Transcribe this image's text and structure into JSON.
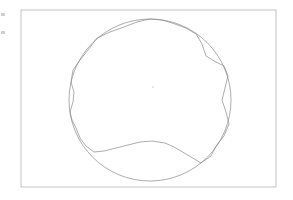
{
  "figure": {
    "title": "",
    "caption": "",
    "background_color": "#ffffff",
    "line_color": "#808080",
    "frame_color": "#b4b4b4",
    "center_mark_color": "#e2e2e2"
  },
  "frame": {
    "name": "plot-frame",
    "x": 21,
    "y": 10,
    "width": 255,
    "height": 177,
    "stroke_width": 0.8
  },
  "center_mark": {
    "x": 153,
    "y": 87,
    "radius": 1.1
  },
  "edge_artifacts": [
    {
      "name": "edge-tick-upper",
      "x": 1,
      "y": 13,
      "width": 4,
      "height": 3
    },
    {
      "name": "edge-tick-lower",
      "x": 1,
      "y": 31,
      "width": 4,
      "height": 3
    }
  ],
  "chart_data": {
    "type": "scatter",
    "title": "",
    "subtitle": "",
    "xlabel": "",
    "ylabel": "",
    "grid": false,
    "legend_position": "none",
    "xlim": [
      21,
      276
    ],
    "ylim": [
      10,
      187
    ],
    "tick_labels": {
      "x": [],
      "y": []
    },
    "annotations": [],
    "series": [
      {
        "name": "circle",
        "kind": "circle",
        "center": [
          150,
          100
        ],
        "radius": 81,
        "stroke": "#8a8a8a",
        "stroke_width": 0.7,
        "fill": "none"
      },
      {
        "name": "polygon",
        "kind": "closed-polyline",
        "stroke": "#8a8a8a",
        "stroke_width": 0.7,
        "fill": "none",
        "points": [
          [
            150,
            19
          ],
          [
            162,
            20
          ],
          [
            172,
            23
          ],
          [
            186,
            28
          ],
          [
            196,
            34
          ],
          [
            202,
            44
          ],
          [
            206,
            56
          ],
          [
            216,
            62
          ],
          [
            224,
            66
          ],
          [
            228,
            76
          ],
          [
            225,
            88
          ],
          [
            222,
            100
          ],
          [
            226,
            112
          ],
          [
            229,
            124
          ],
          [
            224,
            136
          ],
          [
            216,
            146
          ],
          [
            211,
            156
          ],
          [
            201,
            163
          ],
          [
            186,
            154
          ],
          [
            174,
            147
          ],
          [
            165,
            143
          ],
          [
            152,
            141
          ],
          [
            140,
            142
          ],
          [
            128,
            145
          ],
          [
            116,
            148
          ],
          [
            104,
            151
          ],
          [
            94,
            152
          ],
          [
            86,
            146
          ],
          [
            80,
            138
          ],
          [
            76,
            128
          ],
          [
            72,
            120
          ],
          [
            70,
            112
          ],
          [
            73,
            102
          ],
          [
            74,
            92
          ],
          [
            71,
            82
          ],
          [
            73,
            70
          ],
          [
            80,
            60
          ],
          [
            88,
            50
          ],
          [
            97,
            38
          ],
          [
            110,
            32
          ],
          [
            124,
            27
          ],
          [
            137,
            22
          ]
        ]
      }
    ]
  }
}
